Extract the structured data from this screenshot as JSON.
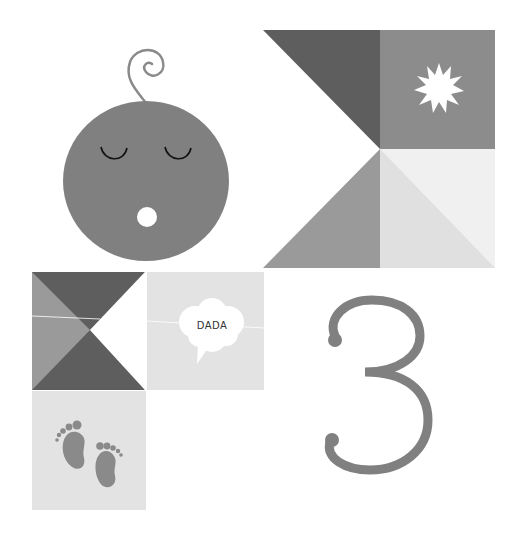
{
  "illustration": {
    "baby_face": {
      "label": "sleeping baby face",
      "color": "#808080"
    },
    "sun_tile": {
      "color": "#8a8a8a",
      "icon": "sun-icon"
    },
    "speech_bubble": {
      "text": "DADA"
    },
    "footprints_tile": {
      "icon": "footprints-icon"
    },
    "number": {
      "text": "3",
      "color": "#7f7f7f"
    }
  },
  "colors": {
    "dark": "#5e5e5e",
    "mid": "#8a8a8a",
    "midlight": "#9a9a9a",
    "light": "#e2e2e2",
    "lighter": "#ececec",
    "white": "#ffffff"
  }
}
